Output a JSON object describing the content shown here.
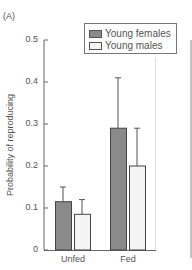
{
  "panel_label": "(A)",
  "legend": {
    "items": [
      {
        "label": "Young females",
        "color": "#8a8a8a"
      },
      {
        "label": "Young males",
        "color": "#f4f4f4"
      }
    ]
  },
  "axis": {
    "ylabel": "Probability of reproducing",
    "yticks": [
      "0",
      "0.1",
      "0.2",
      "0.3",
      "0.4",
      "0.5"
    ],
    "categories": [
      "Unfed",
      "Fed"
    ]
  },
  "chart_data": {
    "type": "bar",
    "title": "",
    "panel": "(A)",
    "xlabel": "",
    "ylabel": "Probability of reproducing",
    "ylim": [
      0,
      0.5
    ],
    "yticks": [
      0,
      0.1,
      0.2,
      0.3,
      0.4,
      0.5
    ],
    "categories": [
      "Unfed",
      "Fed"
    ],
    "series": [
      {
        "name": "Young females",
        "color": "#8a8a8a",
        "values": [
          0.115,
          0.29
        ],
        "error_upper": [
          0.15,
          0.41
        ]
      },
      {
        "name": "Young males",
        "color": "#f4f4f4",
        "values": [
          0.085,
          0.2
        ],
        "error_upper": [
          0.12,
          0.29
        ]
      }
    ],
    "grid": false,
    "legend_position": "upper-right",
    "error_bars": "upper only"
  }
}
